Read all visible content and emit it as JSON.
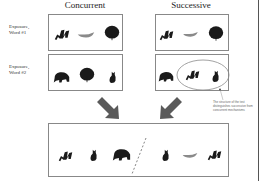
{
  "columns": {
    "concurrent": "Concurrent",
    "successive": "Successive"
  },
  "rows": {
    "word1": "Exposure,\nWord #1",
    "word2": "Exposure,\nWord #2"
  },
  "concurrent": {
    "word1": [
      "seal-icon",
      "fish-icon",
      "tree-icon"
    ],
    "word2": [
      "bear-icon",
      "tree-icon",
      "cat-icon"
    ]
  },
  "successive": {
    "word1": [
      "seal-icon",
      "fish-icon",
      "tree-icon"
    ],
    "word2": [
      "bear-icon",
      "seal-icon",
      "cat-icon"
    ]
  },
  "annotation": "The structure of the test distinguishes successive from concurrent mechanisms",
  "test": {
    "left": [
      "seal-icon",
      "cat-icon",
      "bear-icon"
    ],
    "right": [
      "cat-icon",
      "fish-icon",
      "seal-icon"
    ]
  },
  "colors": {
    "border": "#888888",
    "icon": "#1a1a1a",
    "fish": "#8a8a8a",
    "arrow": "#5a5a5a",
    "ellipse": "#8a8a8a"
  }
}
